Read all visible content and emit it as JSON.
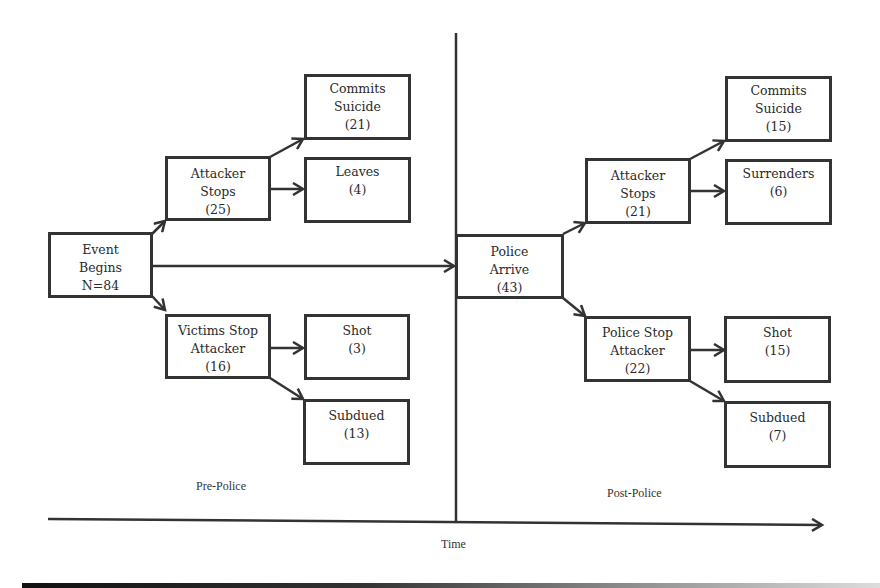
{
  "diagram": {
    "phases": {
      "pre": "Pre-Police",
      "post": "Post-Police"
    },
    "axis_label": "Time",
    "nodes": {
      "event_begins": {
        "lines": [
          "Event",
          "Begins",
          "N=84"
        ]
      },
      "pre_attacker_stops": {
        "lines": [
          "Attacker",
          "Stops",
          "(25)"
        ]
      },
      "pre_commits_suicide": {
        "lines": [
          "Commits",
          "Suicide",
          "(21)"
        ]
      },
      "pre_leaves": {
        "lines": [
          "Leaves",
          "(4)"
        ]
      },
      "victims_stop_attacker": {
        "lines": [
          "Victims Stop",
          "Attacker",
          "(16)"
        ]
      },
      "pre_shot": {
        "lines": [
          "Shot",
          "(3)"
        ]
      },
      "pre_subdued": {
        "lines": [
          "Subdued",
          "(13)"
        ]
      },
      "police_arrive": {
        "lines": [
          "Police",
          "Arrive",
          "(43)"
        ]
      },
      "post_attacker_stops": {
        "lines": [
          "Attacker",
          "Stops",
          "(21)"
        ]
      },
      "post_commits_suicide": {
        "lines": [
          "Commits",
          "Suicide",
          "(15)"
        ]
      },
      "post_surrenders": {
        "lines": [
          "Surrenders",
          "(6)"
        ]
      },
      "police_stop_attacker": {
        "lines": [
          "Police Stop",
          "Attacker",
          "(22)"
        ]
      },
      "post_shot": {
        "lines": [
          "Shot",
          "(15)"
        ]
      },
      "post_subdued": {
        "lines": [
          "Subdued",
          "(7)"
        ]
      }
    },
    "edges": [
      [
        "event_begins",
        "pre_attacker_stops"
      ],
      [
        "event_begins",
        "victims_stop_attacker"
      ],
      [
        "event_begins",
        "police_arrive"
      ],
      [
        "pre_attacker_stops",
        "pre_commits_suicide"
      ],
      [
        "pre_attacker_stops",
        "pre_leaves"
      ],
      [
        "victims_stop_attacker",
        "pre_shot"
      ],
      [
        "victims_stop_attacker",
        "pre_subdued"
      ],
      [
        "police_arrive",
        "post_attacker_stops"
      ],
      [
        "police_arrive",
        "police_stop_attacker"
      ],
      [
        "post_attacker_stops",
        "post_commits_suicide"
      ],
      [
        "post_attacker_stops",
        "post_surrenders"
      ],
      [
        "police_stop_attacker",
        "post_shot"
      ],
      [
        "police_stop_attacker",
        "post_subdued"
      ]
    ],
    "colors": {
      "stroke": "#333333",
      "background": "#ffffff"
    }
  }
}
